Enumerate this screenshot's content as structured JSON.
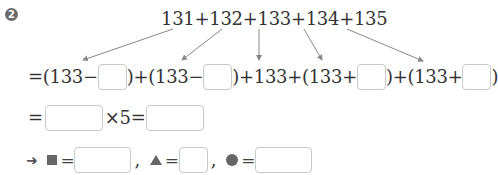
{
  "problem": {
    "number": "2",
    "top_expression": "131+132+133+134+135",
    "row2": {
      "eq": "=",
      "part1_prefix": "(133−",
      "part1_suffix": ")+",
      "part2_prefix": "(133−",
      "part2_suffix": ")+133+",
      "part3_prefix": "(133+",
      "part3_suffix": ")+",
      "part4_prefix": "(133+",
      "part4_suffix": ")"
    },
    "row3": {
      "eq": "=",
      "times": "×5=",
      "multiplier": "5"
    },
    "row4": {
      "arrow": "➜",
      "square_eq": "=",
      "comma1": ",",
      "triangle_eq": "=",
      "comma2": ",",
      "circle_eq": "="
    },
    "answer_boxes": {
      "row2_box1": "",
      "row2_box2": "",
      "row2_box3": "",
      "row2_box4": "",
      "row3_box1": "",
      "row3_box2": "",
      "square_value": "",
      "triangle_value": "",
      "circle_value": ""
    },
    "shapes": [
      "square",
      "triangle",
      "circle"
    ],
    "colors": {
      "text": "#333333",
      "shape_fill": "#666666",
      "box_border": "#c8c8c8",
      "arrow": "#888888"
    }
  }
}
